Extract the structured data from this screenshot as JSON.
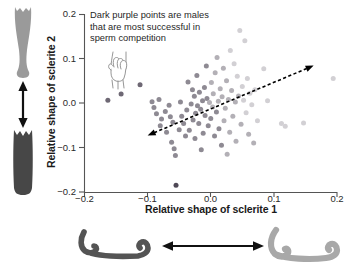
{
  "figure": {
    "title_present": false,
    "annotation": {
      "icon": "pointing-hand-icon",
      "lines": [
        "Dark purple points are males",
        "that are most successful in",
        "sperm competition"
      ]
    },
    "illustrations": {
      "left": {
        "name": "sclerite-2-shape-comparison",
        "top_shape_color": "#9a9a9a",
        "bottom_shape_color": "#4a4a4a",
        "arrow": "double-headed-vertical-arrow"
      },
      "bottom": {
        "name": "sclerite-1-shape-comparison",
        "left_shape_color": "#545454",
        "right_shape_color": "#a8a8a8",
        "arrow": "double-headed-horizontal-arrow"
      }
    }
  },
  "chart_data": {
    "type": "scatter",
    "title": "",
    "xlabel": "Relative shape of sclerite 1",
    "ylabel": "Relative shape of sclerite 2",
    "xlim": [
      -0.2,
      0.2
    ],
    "ylim": [
      -0.2,
      0.2
    ],
    "xticks": [
      -0.2,
      -0.1,
      0.0,
      0.1,
      0.2
    ],
    "xticklabels": [
      "−0.2",
      "−0.1",
      "0.0",
      "0.1",
      "0.2"
    ],
    "yticks": [
      -0.2,
      -0.1,
      0.0,
      0.1,
      0.2
    ],
    "yticklabels": [
      "−0.2",
      "−0.1",
      "0.0",
      "0.1",
      "0.2"
    ],
    "grid": false,
    "legend": null,
    "marker": "filled-circle",
    "marker_size_px": 5.0,
    "colorscale_meaning": "Darker purple = more successful in sperm competition; lighter = less successful",
    "colors": {
      "darkest": "#4f4856",
      "dark": "#6e6874",
      "mid": "#8e8a93",
      "light": "#b3b0b6",
      "lightest": "#d2d0d4",
      "axis": "#555555",
      "trendline": "#000000"
    },
    "annotations": [
      {
        "type": "double-headed-dashed-arrow",
        "name": "major-axis-trend-arrow",
        "x_start": -0.1,
        "y_start": -0.073,
        "x_end": 0.163,
        "y_end": 0.084,
        "style": "dashed",
        "color": "#000000"
      }
    ],
    "points": [
      {
        "x": -0.163,
        "y": 0.006,
        "shade": "dark"
      },
      {
        "x": -0.142,
        "y": 0.02,
        "shade": "dark"
      },
      {
        "x": -0.112,
        "y": 0.041,
        "shade": "dark"
      },
      {
        "x": -0.093,
        "y": 0.003,
        "shade": "mid"
      },
      {
        "x": -0.09,
        "y": -0.01,
        "shade": "mid"
      },
      {
        "x": -0.086,
        "y": -0.024,
        "shade": "mid"
      },
      {
        "x": -0.082,
        "y": 0.008,
        "shade": "mid"
      },
      {
        "x": -0.08,
        "y": -0.051,
        "shade": "mid"
      },
      {
        "x": -0.078,
        "y": -0.036,
        "shade": "mid"
      },
      {
        "x": -0.072,
        "y": -0.019,
        "shade": "mid"
      },
      {
        "x": -0.07,
        "y": -0.066,
        "shade": "mid"
      },
      {
        "x": -0.066,
        "y": -0.005,
        "shade": "mid"
      },
      {
        "x": -0.064,
        "y": -0.031,
        "shade": "mid"
      },
      {
        "x": -0.062,
        "y": -0.088,
        "shade": "mid"
      },
      {
        "x": -0.06,
        "y": -0.043,
        "shade": "mid"
      },
      {
        "x": -0.058,
        "y": -0.103,
        "shade": "mid"
      },
      {
        "x": -0.056,
        "y": -0.118,
        "shade": "mid"
      },
      {
        "x": -0.055,
        "y": -0.185,
        "shade": "darkest"
      },
      {
        "x": -0.05,
        "y": -0.06,
        "shade": "mid"
      },
      {
        "x": -0.048,
        "y": 0.002,
        "shade": "mid"
      },
      {
        "x": -0.046,
        "y": -0.03,
        "shade": "mid"
      },
      {
        "x": -0.043,
        "y": -0.046,
        "shade": "mid"
      },
      {
        "x": -0.04,
        "y": -0.074,
        "shade": "mid"
      },
      {
        "x": -0.038,
        "y": -0.016,
        "shade": "mid"
      },
      {
        "x": -0.036,
        "y": 0.047,
        "shade": "mid"
      },
      {
        "x": -0.034,
        "y": -0.061,
        "shade": "mid"
      },
      {
        "x": -0.031,
        "y": -0.002,
        "shade": "mid"
      },
      {
        "x": -0.029,
        "y": 0.03,
        "shade": "mid"
      },
      {
        "x": -0.028,
        "y": -0.038,
        "shade": "mid"
      },
      {
        "x": -0.026,
        "y": 0.015,
        "shade": "mid"
      },
      {
        "x": -0.025,
        "y": -0.08,
        "shade": "mid"
      },
      {
        "x": -0.024,
        "y": -0.023,
        "shade": "mid"
      },
      {
        "x": -0.022,
        "y": 0.062,
        "shade": "mid"
      },
      {
        "x": -0.021,
        "y": -0.006,
        "shade": "mid"
      },
      {
        "x": -0.019,
        "y": -0.046,
        "shade": "mid"
      },
      {
        "x": -0.018,
        "y": 0.024,
        "shade": "mid"
      },
      {
        "x": -0.016,
        "y": -0.014,
        "shade": "mid"
      },
      {
        "x": -0.015,
        "y": -0.105,
        "shade": "mid"
      },
      {
        "x": -0.013,
        "y": 0.005,
        "shade": "mid"
      },
      {
        "x": -0.012,
        "y": -0.068,
        "shade": "mid"
      },
      {
        "x": -0.01,
        "y": 0.035,
        "shade": "mid"
      },
      {
        "x": -0.009,
        "y": -0.028,
        "shade": "mid"
      },
      {
        "x": -0.007,
        "y": 0.083,
        "shade": "mid"
      },
      {
        "x": -0.006,
        "y": 0.01,
        "shade": "mid"
      },
      {
        "x": -0.004,
        "y": -0.051,
        "shade": "mid"
      },
      {
        "x": -0.002,
        "y": 0.001,
        "shade": "light"
      },
      {
        "x": 0.0,
        "y": -0.035,
        "shade": "mid"
      },
      {
        "x": 0.001,
        "y": 0.046,
        "shade": "light"
      },
      {
        "x": 0.003,
        "y": -0.009,
        "shade": "light"
      },
      {
        "x": 0.004,
        "y": 0.021,
        "shade": "light"
      },
      {
        "x": 0.006,
        "y": -0.074,
        "shade": "mid"
      },
      {
        "x": 0.007,
        "y": 0.068,
        "shade": "light"
      },
      {
        "x": 0.009,
        "y": -0.02,
        "shade": "mid"
      },
      {
        "x": 0.01,
        "y": 0.102,
        "shade": "light"
      },
      {
        "x": 0.012,
        "y": 0.004,
        "shade": "light"
      },
      {
        "x": 0.013,
        "y": -0.058,
        "shade": "mid"
      },
      {
        "x": 0.015,
        "y": 0.032,
        "shade": "light"
      },
      {
        "x": 0.017,
        "y": -0.095,
        "shade": "mid"
      },
      {
        "x": 0.018,
        "y": 0.014,
        "shade": "light"
      },
      {
        "x": 0.02,
        "y": 0.078,
        "shade": "light"
      },
      {
        "x": 0.021,
        "y": -0.04,
        "shade": "light"
      },
      {
        "x": 0.023,
        "y": -0.012,
        "shade": "light"
      },
      {
        "x": 0.025,
        "y": 0.05,
        "shade": "light"
      },
      {
        "x": 0.026,
        "y": -0.115,
        "shade": "light"
      },
      {
        "x": 0.028,
        "y": 0.008,
        "shade": "light"
      },
      {
        "x": 0.03,
        "y": -0.066,
        "shade": "light"
      },
      {
        "x": 0.031,
        "y": 0.118,
        "shade": "lightest"
      },
      {
        "x": 0.033,
        "y": 0.028,
        "shade": "light"
      },
      {
        "x": 0.035,
        "y": -0.03,
        "shade": "light"
      },
      {
        "x": 0.037,
        "y": 0.088,
        "shade": "lightest"
      },
      {
        "x": 0.039,
        "y": 0.002,
        "shade": "light"
      },
      {
        "x": 0.04,
        "y": -0.086,
        "shade": "light"
      },
      {
        "x": 0.042,
        "y": 0.06,
        "shade": "lightest"
      },
      {
        "x": 0.044,
        "y": 0.016,
        "shade": "light"
      },
      {
        "x": 0.046,
        "y": 0.163,
        "shade": "lightest"
      },
      {
        "x": 0.048,
        "y": -0.048,
        "shade": "light"
      },
      {
        "x": 0.05,
        "y": 0.037,
        "shade": "lightest"
      },
      {
        "x": 0.052,
        "y": 0.006,
        "shade": "lightest"
      },
      {
        "x": 0.054,
        "y": 0.14,
        "shade": "lightest"
      },
      {
        "x": 0.056,
        "y": -0.022,
        "shade": "lightest"
      },
      {
        "x": 0.058,
        "y": 0.055,
        "shade": "lightest"
      },
      {
        "x": 0.06,
        "y": -0.07,
        "shade": "light"
      },
      {
        "x": 0.062,
        "y": 0.022,
        "shade": "lightest"
      },
      {
        "x": 0.065,
        "y": -0.004,
        "shade": "lightest"
      },
      {
        "x": 0.068,
        "y": -0.09,
        "shade": "light"
      },
      {
        "x": 0.07,
        "y": 0.03,
        "shade": "lightest"
      },
      {
        "x": 0.074,
        "y": -0.04,
        "shade": "lightest"
      },
      {
        "x": 0.084,
        "y": 0.077,
        "shade": "lightest"
      },
      {
        "x": 0.09,
        "y": 0.005,
        "shade": "lightest"
      },
      {
        "x": 0.112,
        "y": -0.046,
        "shade": "lightest"
      },
      {
        "x": 0.118,
        "y": -0.052,
        "shade": "lightest"
      },
      {
        "x": 0.147,
        "y": -0.045,
        "shade": "lightest"
      },
      {
        "x": 0.194,
        "y": 0.055,
        "shade": "lightest"
      }
    ]
  }
}
